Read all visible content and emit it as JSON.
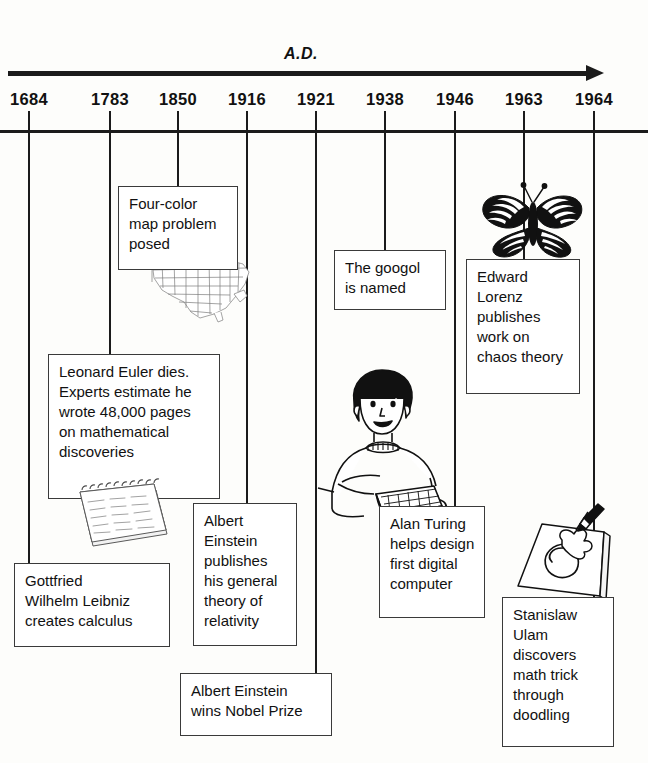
{
  "timeline": {
    "era_label": "A.D.",
    "arrow_direction": "right",
    "ink_color": "#1b1b1b",
    "years": [
      {
        "label": "1684",
        "x": 29
      },
      {
        "label": "1783",
        "x": 110
      },
      {
        "label": "1850",
        "x": 178
      },
      {
        "label": "1916",
        "x": 247
      },
      {
        "label": "1921",
        "x": 316
      },
      {
        "label": "1938",
        "x": 385
      },
      {
        "label": "1946",
        "x": 455
      },
      {
        "label": "1963",
        "x": 524
      },
      {
        "label": "1964",
        "x": 594
      }
    ],
    "events": [
      {
        "year": "1684",
        "name": "gottfried-leibniz",
        "text": "Gottfried Wilhelm Leibniz creates calculus",
        "lines": [
          "Gottfried",
          "Wilhelm Leibniz",
          "creates calculus"
        ]
      },
      {
        "year": "1783",
        "name": "leonard-euler",
        "text": "Leonard Euler dies. Experts estimate he wrote 48,000 pages on mathematical discoveries",
        "lines": [
          "Leonard Euler dies.",
          "Experts estimate he",
          "wrote 48,000 pages",
          "on mathematical",
          "discoveries"
        ],
        "illustration": "spiral-notepad-icon"
      },
      {
        "year": "1850",
        "name": "four-color-map",
        "text": "Four-color map problem posed",
        "lines": [
          "Four-color",
          "map problem",
          "posed"
        ],
        "illustration": "united-states-map-icon"
      },
      {
        "year": "1916",
        "name": "einstein-general-relativity",
        "text": "Albert Einstein publishes his general theory of relativity",
        "lines": [
          "Albert",
          "Einstein",
          "publishes",
          "his general",
          "theory of",
          "relativity"
        ]
      },
      {
        "year": "1921",
        "name": "einstein-nobel-prize",
        "text": "Albert Einstein wins Nobel Prize",
        "lines": [
          "Albert Einstein",
          "wins Nobel Prize"
        ]
      },
      {
        "year": "1938",
        "name": "googol-named",
        "text": "The googol is named",
        "lines": [
          "The googol",
          "is named"
        ]
      },
      {
        "year": "1946",
        "name": "alan-turing",
        "text": "Alan Turing helps design first digital computer",
        "lines": [
          "Alan Turing",
          "helps design",
          "first digital",
          "computer"
        ],
        "illustration": "person-at-keyboard-icon"
      },
      {
        "year": "1963",
        "name": "edward-lorenz",
        "text": "Edward Lorenz publishes work on chaos theory",
        "lines": [
          "Edward",
          "Lorenz",
          "publishes",
          "work on",
          "chaos theory"
        ],
        "illustration": "butterfly-icon"
      },
      {
        "year": "1964",
        "name": "stanislaw-ulam",
        "text": "Stanislaw Ulam discovers math trick through doodling",
        "lines": [
          "Stanislaw",
          "Ulam",
          "discovers",
          "math trick",
          "through",
          "doodling"
        ],
        "illustration": "hand-drawing-spiral-icon"
      }
    ]
  },
  "boxes": {
    "leibniz": {
      "l": 14,
      "t": 563,
      "w": 156,
      "h": 84,
      "line_x": 29,
      "line_top": 133
    },
    "euler": {
      "l": 48,
      "t": 354,
      "w": 172,
      "h": 145,
      "line_x": 110,
      "line_top": 133
    },
    "fourcolor": {
      "l": 118,
      "t": 186,
      "w": 120,
      "h": 84,
      "line_x": 178,
      "line_top": 133
    },
    "einstein1": {
      "l": 193,
      "t": 503,
      "w": 104,
      "h": 143,
      "line_x": 247,
      "line_top": 133
    },
    "einstein2": {
      "l": 180,
      "t": 673,
      "w": 152,
      "h": 63,
      "line_x": 316,
      "line_top": 133
    },
    "googol": {
      "l": 334,
      "t": 250,
      "w": 112,
      "h": 60,
      "line_x": 385,
      "line_top": 133
    },
    "turing": {
      "l": 379,
      "t": 506,
      "w": 106,
      "h": 112,
      "line_x": 455,
      "line_top": 133
    },
    "lorenz": {
      "l": 466,
      "t": 259,
      "w": 114,
      "h": 135,
      "line_x": 524,
      "line_top": 133
    },
    "ulam": {
      "l": 502,
      "t": 597,
      "w": 112,
      "h": 150,
      "line_x": 594,
      "line_top": 133
    }
  }
}
